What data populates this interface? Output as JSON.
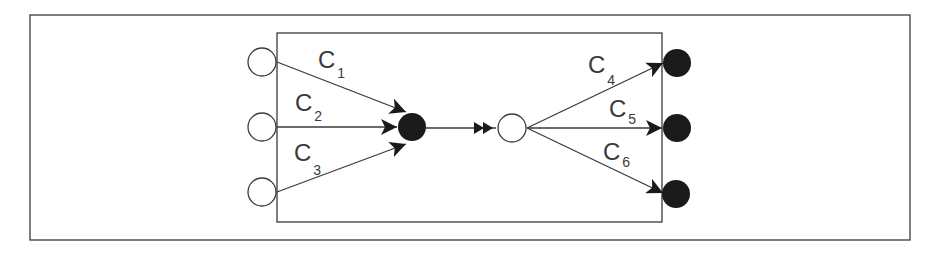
{
  "diagram": {
    "type": "network-flow",
    "colors": {
      "stroke": "#3a3a3a",
      "filled_node": "#1a1a1a",
      "open_node": "#ffffff"
    },
    "inputs": [
      {
        "id": "in1",
        "fill": "open"
      },
      {
        "id": "in2",
        "fill": "open"
      },
      {
        "id": "in3",
        "fill": "open"
      }
    ],
    "hub_in": {
      "fill": "filled"
    },
    "hub_out": {
      "fill": "open"
    },
    "outputs": [
      {
        "id": "out1",
        "fill": "filled"
      },
      {
        "id": "out2",
        "fill": "filled"
      },
      {
        "id": "out3",
        "fill": "filled"
      }
    ],
    "edges": [
      {
        "label": "C",
        "sub": "1"
      },
      {
        "label": "C",
        "sub": "2"
      },
      {
        "label": "C",
        "sub": "3"
      },
      {
        "label": "C",
        "sub": "4"
      },
      {
        "label": "C",
        "sub": "5"
      },
      {
        "label": "C",
        "sub": "6"
      }
    ]
  }
}
